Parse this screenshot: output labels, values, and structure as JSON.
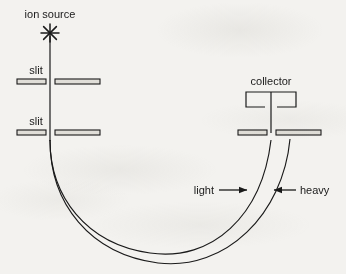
{
  "figure": {
    "kind": "schematic-diagram",
    "background_color": "#f3f2ef",
    "ink_color": "#1a1a1a"
  },
  "labels": {
    "ion_source": "ion source",
    "slit_upper": "slit",
    "slit_lower": "slit",
    "collector": "collector",
    "light": "light",
    "heavy": "heavy"
  },
  "components": {
    "ion_source": {
      "icon": "starburst-icon",
      "x": 50,
      "y": 33,
      "rays": 8,
      "ray_length": 9
    },
    "beam_line": {
      "x": 50,
      "y_start": 36,
      "y_end": 140
    },
    "slit_upper": {
      "y": 81,
      "left_bar": {
        "x": 17,
        "width": 29,
        "height": 5
      },
      "right_bar": {
        "x": 55,
        "width": 45,
        "height": 5
      },
      "gap_center": 50
    },
    "slit_lower": {
      "y": 132,
      "left_bar": {
        "x": 17,
        "width": 29,
        "height": 5
      },
      "right_bar": {
        "x": 55,
        "width": 45,
        "height": 5
      },
      "gap_center": 50
    },
    "collector_box": {
      "x": 246,
      "y": 92,
      "width": 50,
      "height": 15,
      "open_bottom_gap": [
        265,
        277
      ]
    },
    "collector_stem": {
      "x": 271,
      "y_start": 92,
      "y_end": 132
    },
    "slit_right": {
      "y": 132,
      "left_bar": {
        "x": 238,
        "width": 29,
        "height": 5
      },
      "right_bar": {
        "x": 276,
        "width": 45,
        "height": 5
      },
      "gap_center": 271
    },
    "curve_light": {
      "name": "light-ion-trajectory",
      "description": "inner trajectory, smaller radius, ends at collector slit gap",
      "path": "M 50 140 C 50 196, 86 244, 150 253 C 212 262, 262 216, 271 140"
    },
    "curve_heavy": {
      "name": "heavy-ion-trajectory",
      "description": "outer trajectory, larger radius, ends at right bar of collector slit",
      "path": "M 50 140 C 50 204, 90 254, 158 263 C 226 271, 282 214, 290 139"
    },
    "arrow_light": {
      "from_x": 218,
      "to_x": 247,
      "y": 190,
      "direction": "right"
    },
    "arrow_heavy": {
      "from_x": 296,
      "to_x": 276,
      "y": 190,
      "direction": "left"
    }
  }
}
